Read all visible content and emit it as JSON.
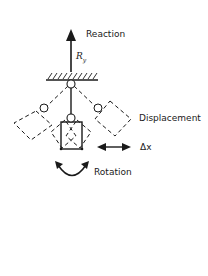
{
  "diagram": {
    "labels": {
      "reaction": "Reaction",
      "reaction_symbol": "R",
      "reaction_subscript": "y",
      "displacement": "Displacement",
      "delta_x": "Δx",
      "rotation": "Rotation"
    },
    "colors": {
      "stroke": "#1a1a1a",
      "background": "#ffffff"
    }
  }
}
